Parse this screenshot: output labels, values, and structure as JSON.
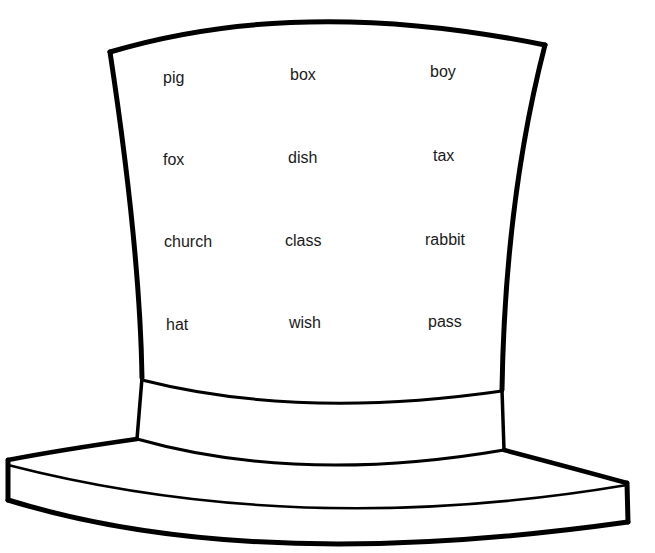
{
  "worksheet": {
    "figure": "top-hat",
    "words": [
      {
        "text": "pig",
        "x": 163,
        "y": 70
      },
      {
        "text": "box",
        "x": 290,
        "y": 67
      },
      {
        "text": "boy",
        "x": 430,
        "y": 64
      },
      {
        "text": "fox",
        "x": 163,
        "y": 152
      },
      {
        "text": "dish",
        "x": 288,
        "y": 150
      },
      {
        "text": "tax",
        "x": 433,
        "y": 148
      },
      {
        "text": "church",
        "x": 164,
        "y": 234
      },
      {
        "text": "class",
        "x": 285,
        "y": 233
      },
      {
        "text": "rabbit",
        "x": 425,
        "y": 232
      },
      {
        "text": "hat",
        "x": 166,
        "y": 317
      },
      {
        "text": "wish",
        "x": 289,
        "y": 315
      },
      {
        "text": "pass",
        "x": 428,
        "y": 314
      }
    ],
    "colors": {
      "outline": "#000000",
      "text": "#1a1a1a",
      "background": "#ffffff"
    }
  }
}
